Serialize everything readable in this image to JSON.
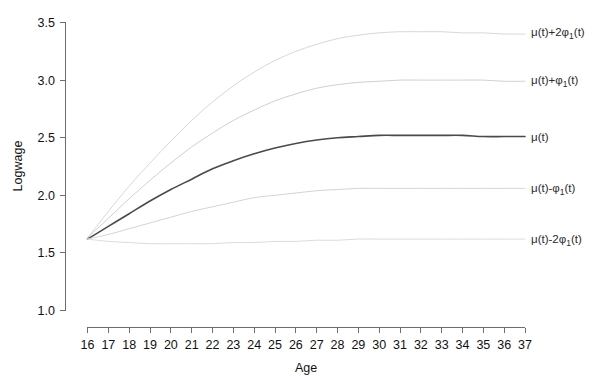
{
  "chart_data": {
    "type": "line",
    "title": "",
    "xlabel": "Age",
    "ylabel": "Logwage",
    "xlim": [
      16,
      37
    ],
    "ylim": [
      1.0,
      3.5
    ],
    "grid": false,
    "legend_position": "right-inline-labels",
    "x_ticks": [
      16,
      17,
      18,
      19,
      20,
      21,
      22,
      23,
      24,
      25,
      26,
      27,
      28,
      29,
      30,
      31,
      32,
      33,
      34,
      35,
      36,
      37
    ],
    "y_ticks": [
      "1.0",
      "1.5",
      "2.0",
      "2.5",
      "3.0",
      "3.5"
    ],
    "x": [
      16,
      17,
      18,
      19,
      20,
      21,
      22,
      23,
      24,
      25,
      26,
      27,
      28,
      29,
      30,
      31,
      32,
      33,
      34,
      35,
      36,
      37
    ],
    "series": [
      {
        "name": "mu(t)+2phi_1(t)",
        "label_parts": {
          "prefix": "μ(t)+2φ",
          "subscript": "1",
          "suffix": "(t)"
        },
        "color": "#d8d8d8",
        "width": 1.0,
        "style": "solid",
        "values": [
          1.63,
          1.86,
          2.08,
          2.28,
          2.47,
          2.65,
          2.81,
          2.95,
          3.07,
          3.17,
          3.25,
          3.31,
          3.36,
          3.39,
          3.41,
          3.42,
          3.42,
          3.42,
          3.41,
          3.41,
          3.4,
          3.4
        ]
      },
      {
        "name": "mu(t)+phi_1(t)",
        "label_parts": {
          "prefix": "μ(t)+φ",
          "subscript": "1",
          "suffix": "(t)"
        },
        "color": "#d0d0d0",
        "width": 1.0,
        "style": "solid",
        "values": [
          1.63,
          1.8,
          1.97,
          2.13,
          2.28,
          2.42,
          2.54,
          2.65,
          2.74,
          2.82,
          2.88,
          2.93,
          2.96,
          2.98,
          2.99,
          3.0,
          3.0,
          3.0,
          3.0,
          3.0,
          2.99,
          2.99
        ]
      },
      {
        "name": "mu(t)",
        "label_parts": {
          "prefix": "μ(t)",
          "subscript": "",
          "suffix": ""
        },
        "color": "#4a4a4a",
        "width": 1.6,
        "style": "solid",
        "values": [
          1.62,
          1.73,
          1.84,
          1.95,
          2.05,
          2.14,
          2.23,
          2.3,
          2.36,
          2.41,
          2.45,
          2.48,
          2.5,
          2.51,
          2.52,
          2.52,
          2.52,
          2.52,
          2.52,
          2.51,
          2.51,
          2.51
        ]
      },
      {
        "name": "mu(t)-phi_1(t)",
        "label_parts": {
          "prefix": "μ(t)-φ",
          "subscript": "1",
          "suffix": "(t)"
        },
        "color": "#d4d4d4",
        "width": 1.0,
        "style": "solid",
        "values": [
          1.62,
          1.66,
          1.71,
          1.76,
          1.81,
          1.86,
          1.9,
          1.94,
          1.98,
          2.0,
          2.02,
          2.04,
          2.05,
          2.06,
          2.06,
          2.06,
          2.06,
          2.06,
          2.06,
          2.06,
          2.06,
          2.06
        ]
      },
      {
        "name": "mu(t)-2phi_1(t)",
        "label_parts": {
          "prefix": "μ(t)-2φ",
          "subscript": "1",
          "suffix": "(t)"
        },
        "color": "#dcdcdc",
        "width": 1.0,
        "style": "solid",
        "values": [
          1.62,
          1.6,
          1.59,
          1.58,
          1.58,
          1.58,
          1.58,
          1.59,
          1.59,
          1.6,
          1.6,
          1.61,
          1.61,
          1.62,
          1.62,
          1.62,
          1.62,
          1.62,
          1.62,
          1.62,
          1.62,
          1.62
        ]
      }
    ]
  },
  "axes": {
    "x_title": "Age",
    "y_title": "Logwage",
    "x_tick_labels": [
      "16",
      "17",
      "18",
      "19",
      "20",
      "21",
      "22",
      "23",
      "24",
      "25",
      "26",
      "27",
      "28",
      "29",
      "30",
      "31",
      "32",
      "33",
      "34",
      "35",
      "36",
      "37"
    ],
    "y_tick_labels": [
      "3.5",
      "3.0",
      "2.5",
      "2.0",
      "1.5",
      "1.0"
    ]
  },
  "labels": {
    "upper2": {
      "prefix": "μ(t)+2φ",
      "sub": "1",
      "suffix": "(t)"
    },
    "upper1": {
      "prefix": "μ(t)+φ",
      "sub": "1",
      "suffix": "(t)"
    },
    "mean": {
      "prefix": "μ(t)",
      "sub": "",
      "suffix": ""
    },
    "lower1": {
      "prefix": "μ(t)-φ",
      "sub": "1",
      "suffix": "(t)"
    },
    "lower2": {
      "prefix": "μ(t)-2φ",
      "sub": "1",
      "suffix": "(t)"
    }
  },
  "colors": {
    "mean_curve": "#4a4a4a",
    "band_curve": "#d6d6d6",
    "axis": "#6e6e6e",
    "text": "#111111",
    "background": "#ffffff"
  }
}
